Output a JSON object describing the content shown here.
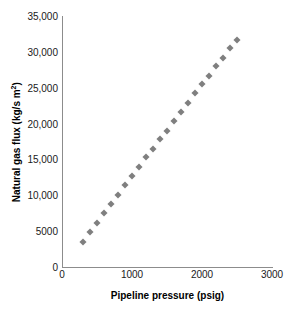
{
  "chart_data": {
    "type": "scatter",
    "title": "",
    "xlabel": "Pipeline pressure (psig)",
    "ylabel": "Natural gas flux (kg/s m²)",
    "ylabel_base": "Natural gas flux (kg/s m",
    "ylabel_sup": "2",
    "ylabel_tail": ")",
    "xlim": [
      0,
      3000
    ],
    "ylim": [
      0,
      35000
    ],
    "grid": false,
    "legend": "none",
    "marker": {
      "shape": "diamond",
      "color": "#7f7f7f",
      "size": 5
    },
    "xticks": [
      0,
      1000,
      2000,
      3000
    ],
    "xtick_labels": [
      "0",
      "1000",
      "2000",
      "3000"
    ],
    "yticks": [
      0,
      5000,
      10000,
      15000,
      20000,
      25000,
      30000,
      35000
    ],
    "ytick_labels": [
      "0",
      "5000",
      "10,000",
      "15,000",
      "20,000",
      "25,000",
      "30,000",
      "35,000"
    ],
    "x": [
      300,
      400,
      500,
      600,
      700,
      800,
      900,
      1000,
      1100,
      1200,
      1300,
      1400,
      1500,
      1600,
      1700,
      1800,
      1900,
      2000,
      2100,
      2200,
      2300,
      2400,
      2500
    ],
    "values": [
      3500,
      4900,
      6200,
      7500,
      8800,
      10100,
      11400,
      12700,
      14000,
      15300,
      16500,
      17800,
      19000,
      20300,
      21600,
      22900,
      24200,
      25500,
      26700,
      28000,
      29200,
      30500,
      31700
    ]
  },
  "axis_colors": {
    "axis_line": "#8c8c8c",
    "tick_text": "#1a1a1a",
    "title_text": "#000000",
    "background": "#ffffff"
  }
}
